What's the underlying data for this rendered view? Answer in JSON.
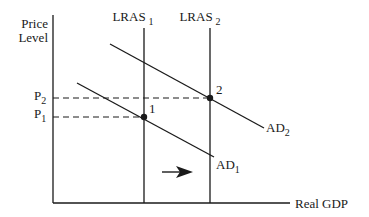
{
  "diagram": {
    "type": "AD-LRAS economic diagram",
    "y_axis": {
      "label_line1": "Price",
      "label_line2": "Level"
    },
    "x_axis": {
      "label": "Real GDP"
    },
    "curves": {
      "lras1": {
        "base": "LRAS",
        "sub": "1"
      },
      "lras2": {
        "base": "LRAS",
        "sub": "2"
      },
      "ad1": {
        "base": "AD",
        "sub": "1"
      },
      "ad2": {
        "base": "AD",
        "sub": "2"
      }
    },
    "price_levels": {
      "p1": {
        "base": "P",
        "sub": "1"
      },
      "p2": {
        "base": "P",
        "sub": "2"
      }
    },
    "points": {
      "point1": "1",
      "point2": "2"
    },
    "shift_arrow": {
      "direction": "right"
    },
    "colors": {
      "ink": "#1a1a1a",
      "background": "#ffffff"
    }
  }
}
